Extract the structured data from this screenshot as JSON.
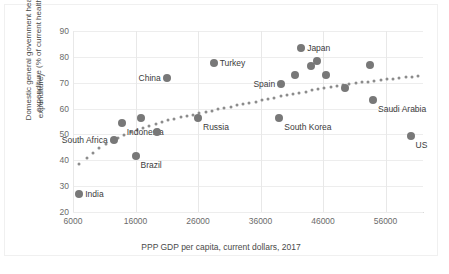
{
  "chart_data": {
    "type": "scatter",
    "title": "",
    "xlabel": "PPP GDP per capita, current dollars, 2017",
    "ylabel_line1": "Domestic general government health",
    "ylabel_line2": "expenditure (% of current health",
    "ylabel_line3": "expenditure)",
    "xlim": [
      6000,
      62000
    ],
    "ylim": [
      20,
      90
    ],
    "xticks": [
      6000,
      16000,
      26000,
      36000,
      46000,
      56000
    ],
    "yticks": [
      20,
      30,
      40,
      50,
      60,
      70,
      80,
      90
    ],
    "grid": true,
    "legend": "none",
    "marker_color": "#787878",
    "trendline_color": "#8c8c8c",
    "trendline_style": "dotted",
    "points": [
      {
        "label": "India",
        "x": 7000,
        "y": 27.0,
        "labelPos": "right"
      },
      {
        "label": "South Africa",
        "x": 12500,
        "y": 48.0,
        "labelPos": "left"
      },
      {
        "label": "Indonesia",
        "x": 13800,
        "y": 54.5,
        "labelPos": "below"
      },
      {
        "label": "Brazil",
        "x": 16000,
        "y": 41.5,
        "labelPos": "below"
      },
      {
        "label": "",
        "x": 16800,
        "y": 56.5,
        "labelPos": "none"
      },
      {
        "label": "",
        "x": 19500,
        "y": 51.0,
        "labelPos": "none"
      },
      {
        "label": "China",
        "x": 21000,
        "y": 72.0,
        "labelPos": "left"
      },
      {
        "label": "Russia",
        "x": 26000,
        "y": 56.5,
        "labelPos": "below"
      },
      {
        "label": "Turkey",
        "x": 28500,
        "y": 77.5,
        "labelPos": "right"
      },
      {
        "label": "South Korea",
        "x": 39000,
        "y": 56.5,
        "labelPos": "below"
      },
      {
        "label": "Spain",
        "x": 39300,
        "y": 69.5,
        "labelPos": "left"
      },
      {
        "label": "",
        "x": 41500,
        "y": 73.0,
        "labelPos": "none"
      },
      {
        "label": "Japan",
        "x": 42500,
        "y": 83.5,
        "labelPos": "right"
      },
      {
        "label": "",
        "x": 44000,
        "y": 76.5,
        "labelPos": "none"
      },
      {
        "label": "",
        "x": 45000,
        "y": 78.5,
        "labelPos": "none"
      },
      {
        "label": "",
        "x": 46500,
        "y": 73.0,
        "labelPos": "none"
      },
      {
        "label": "",
        "x": 49500,
        "y": 68.0,
        "labelPos": "none"
      },
      {
        "label": "",
        "x": 53500,
        "y": 77.0,
        "labelPos": "none"
      },
      {
        "label": "Saudi Arabia",
        "x": 54000,
        "y": 63.5,
        "labelPos": "below"
      },
      {
        "label": "US",
        "x": 60000,
        "y": 49.5,
        "labelPos": "below"
      }
    ],
    "trendline": [
      {
        "x": 7000,
        "y": 38.5
      },
      {
        "x": 8200,
        "y": 41.0
      },
      {
        "x": 9200,
        "y": 43.0
      },
      {
        "x": 10200,
        "y": 44.8
      },
      {
        "x": 11200,
        "y": 46.3
      },
      {
        "x": 12200,
        "y": 47.6
      },
      {
        "x": 13200,
        "y": 48.8
      },
      {
        "x": 14200,
        "y": 49.9
      },
      {
        "x": 15200,
        "y": 50.9
      },
      {
        "x": 16200,
        "y": 51.8
      },
      {
        "x": 17200,
        "y": 52.6
      },
      {
        "x": 18200,
        "y": 53.4
      },
      {
        "x": 19200,
        "y": 54.1
      },
      {
        "x": 20200,
        "y": 54.8
      },
      {
        "x": 21200,
        "y": 55.4
      },
      {
        "x": 22200,
        "y": 56.0
      },
      {
        "x": 23200,
        "y": 56.6
      },
      {
        "x": 24200,
        "y": 57.1
      },
      {
        "x": 25200,
        "y": 57.7
      },
      {
        "x": 26200,
        "y": 58.2
      },
      {
        "x": 27200,
        "y": 58.7
      },
      {
        "x": 28200,
        "y": 59.2
      },
      {
        "x": 29200,
        "y": 59.7
      },
      {
        "x": 30200,
        "y": 60.2
      },
      {
        "x": 31200,
        "y": 60.7
      },
      {
        "x": 32200,
        "y": 61.2
      },
      {
        "x": 33200,
        "y": 61.7
      },
      {
        "x": 34200,
        "y": 62.2
      },
      {
        "x": 35200,
        "y": 62.7
      },
      {
        "x": 36200,
        "y": 63.2
      },
      {
        "x": 37200,
        "y": 63.7
      },
      {
        "x": 38200,
        "y": 64.2
      },
      {
        "x": 39200,
        "y": 64.7
      },
      {
        "x": 40200,
        "y": 65.2
      },
      {
        "x": 41200,
        "y": 65.7
      },
      {
        "x": 42200,
        "y": 66.2
      },
      {
        "x": 43200,
        "y": 66.6
      },
      {
        "x": 44200,
        "y": 67.0
      },
      {
        "x": 45200,
        "y": 67.4
      },
      {
        "x": 46200,
        "y": 67.8
      },
      {
        "x": 47200,
        "y": 68.2
      },
      {
        "x": 48200,
        "y": 68.6
      },
      {
        "x": 49200,
        "y": 69.0
      },
      {
        "x": 50200,
        "y": 69.4
      },
      {
        "x": 51200,
        "y": 69.8
      },
      {
        "x": 52200,
        "y": 70.1
      },
      {
        "x": 53200,
        "y": 70.4
      },
      {
        "x": 54200,
        "y": 70.7
      },
      {
        "x": 55200,
        "y": 71.0
      },
      {
        "x": 56200,
        "y": 71.3
      },
      {
        "x": 57200,
        "y": 71.6
      },
      {
        "x": 58200,
        "y": 71.9
      },
      {
        "x": 59200,
        "y": 72.2
      },
      {
        "x": 60200,
        "y": 72.4
      },
      {
        "x": 61200,
        "y": 72.6
      }
    ]
  }
}
